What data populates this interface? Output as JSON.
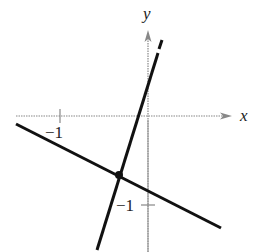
{
  "figure": {
    "type": "coordinate-graph",
    "axes": {
      "x_label": "x",
      "y_label": "y",
      "x_tick_label": "−1",
      "y_tick_label": "−1",
      "x_tick_value": -1,
      "y_tick_value": -1
    },
    "lines": [
      {
        "name": "steep-line",
        "equation": "y = 3x + 1/3",
        "slope": 3,
        "intercept": 0.333
      },
      {
        "name": "shallow-line",
        "equation": "y = -x/2 - 5/6",
        "slope": -0.5,
        "intercept": -0.833
      }
    ],
    "intersection": {
      "x": -0.333,
      "y": -0.667
    },
    "colors": {
      "line": "#111111",
      "axis": "#888888",
      "text": "#222222"
    }
  }
}
